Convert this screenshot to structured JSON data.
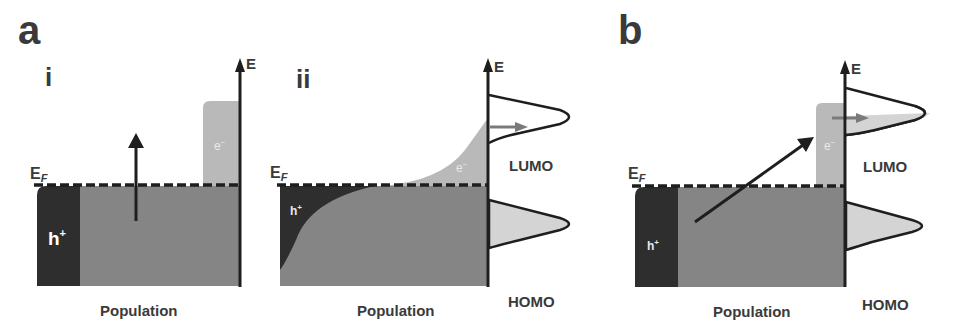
{
  "panels": {
    "a_label": "a",
    "b_label": "b",
    "i_label": "i",
    "ii_label": "ii"
  },
  "axis": {
    "energy_label": "E",
    "fermi_label_main": "E",
    "fermi_label_sub": "F",
    "population_label": "Population"
  },
  "carriers": {
    "hole": "h",
    "hole_sup": "+",
    "electron": "e",
    "electron_sup": "−"
  },
  "orbitals": {
    "lumo": "LUMO",
    "homo": "HOMO"
  },
  "colors": {
    "hole_region": "#2e2e2e",
    "filled_band": "#858585",
    "electron_region": "#b9b9b9",
    "orbital_fill": "#d4d4d4",
    "axis": "#1e1e1e",
    "text": "#3a3a3a",
    "transfer_arrow": "#7a7a7a"
  }
}
